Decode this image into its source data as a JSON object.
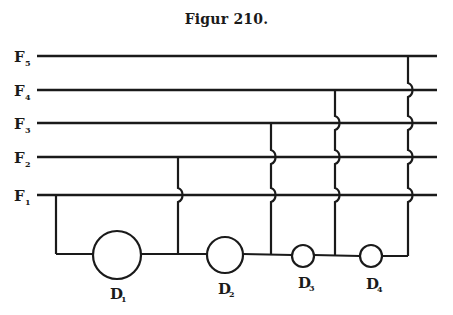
{
  "figure": {
    "title": "Figur 210."
  },
  "colors": {
    "ink": "#1a1a1a",
    "paper": "#ffffff"
  },
  "feeders": [
    {
      "label": "F",
      "sub": "5",
      "y": 56
    },
    {
      "label": "F",
      "sub": "4",
      "y": 90
    },
    {
      "label": "F",
      "sub": "3",
      "y": 123
    },
    {
      "label": "F",
      "sub": "2",
      "y": 157
    },
    {
      "label": "F",
      "sub": "1",
      "y": 195
    }
  ],
  "dynamos": [
    {
      "label": "D",
      "sub": "1",
      "cx": 117,
      "cy": 255,
      "r": 24
    },
    {
      "label": "D",
      "sub": "2",
      "cx": 225,
      "cy": 255,
      "r": 18
    },
    {
      "label": "D",
      "sub": "3",
      "cx": 303,
      "cy": 256,
      "r": 11
    },
    {
      "label": "D",
      "sub": "4",
      "cx": 371,
      "cy": 256,
      "r": 11
    }
  ],
  "connections": [
    {
      "x": 56,
      "from_feeder": "F1",
      "hops": []
    },
    {
      "x": 178,
      "from_feeder": "F2",
      "hops": [
        "F1"
      ]
    },
    {
      "x": 271,
      "from_feeder": "F3",
      "hops": [
        "F2",
        "F1"
      ]
    },
    {
      "x": 335,
      "from_feeder": "F4",
      "hops": [
        "F3",
        "F2",
        "F1"
      ]
    },
    {
      "x": 408,
      "from_feeder": "F5",
      "hops": [
        "F4",
        "F3",
        "F2",
        "F1"
      ]
    }
  ]
}
